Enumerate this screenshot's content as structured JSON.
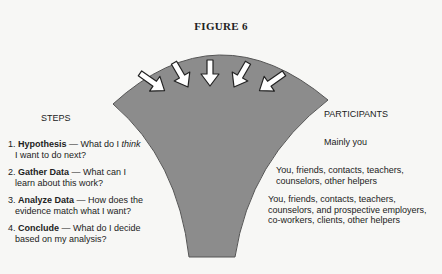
{
  "figure": {
    "title": "FIGURE 6"
  },
  "diagram": {
    "type": "funnel",
    "fill_color": "#8c8c8c",
    "arrow_count": 5
  },
  "steps": {
    "heading": "STEPS",
    "items": [
      {
        "num": "1.",
        "name": "Hypothesis",
        "dash": " — ",
        "text_a": "What do I ",
        "text_em": "think",
        "line2": "I want to do next?"
      },
      {
        "num": "2.",
        "name": "Gather Data",
        "dash": " — ",
        "text_a": "What can I",
        "text_em": "",
        "line2": "learn about this work?"
      },
      {
        "num": "3.",
        "name": "Analyze Data",
        "dash": " — ",
        "text_a": "How does the",
        "text_em": "",
        "line2": "evidence match what I want?"
      },
      {
        "num": "4.",
        "name": "Conclude",
        "dash": " — ",
        "text_a": "What do I decide",
        "text_em": "",
        "line2": "based on my analysis?"
      }
    ]
  },
  "participants": {
    "heading": "PARTICIPANTS",
    "items": [
      {
        "line1": "Mainly you"
      },
      {
        "line1": "You, friends, contacts, teachers,",
        "line2": "counselors, other helpers"
      },
      {
        "line1": "You, friends, contacts, teachers,",
        "line2": "counselors, and prospective employers,",
        "line3": "co-workers, clients, other helpers"
      }
    ]
  }
}
